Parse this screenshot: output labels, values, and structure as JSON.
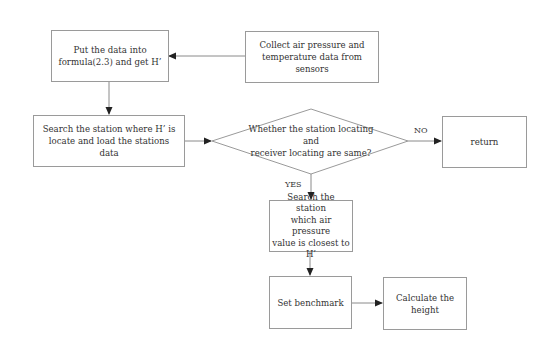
{
  "diagram": {
    "type": "flowchart",
    "nodes": {
      "put_data": {
        "label": "Put the data into\nformula(2.3) and get H’",
        "shape": "rectangle"
      },
      "collect": {
        "label": "Collect air pressure  and\ntemperature data from sensors",
        "shape": "rectangle"
      },
      "search_station": {
        "label": "Search the station where H’  is\nlocate and load the stations data",
        "shape": "rectangle"
      },
      "decision": {
        "label": "Whether the station locating and\nreceiver locating are same?",
        "shape": "diamond"
      },
      "return": {
        "label": "return",
        "shape": "rectangle"
      },
      "search_closest": {
        "label": "Search the station\nwhich air pressure\nvalue is closest to\nH’",
        "shape": "rectangle"
      },
      "benchmark": {
        "label": "Set benchmark",
        "shape": "rectangle"
      },
      "calculate": {
        "label": "Calculate the\nheight",
        "shape": "rectangle"
      }
    },
    "edges": [
      {
        "from": "collect",
        "to": "put_data",
        "label": ""
      },
      {
        "from": "put_data",
        "to": "search_station",
        "label": ""
      },
      {
        "from": "search_station",
        "to": "decision",
        "label": ""
      },
      {
        "from": "decision",
        "to": "return",
        "label": "NO"
      },
      {
        "from": "decision",
        "to": "search_closest",
        "label": "YES"
      },
      {
        "from": "search_closest",
        "to": "benchmark",
        "label": ""
      },
      {
        "from": "benchmark",
        "to": "calculate",
        "label": ""
      }
    ],
    "edge_labels": {
      "no": "NO",
      "yes": "YES"
    },
    "colors": {
      "line": "#8a8a8a",
      "arrow": "#222222",
      "text": "#333333"
    }
  }
}
